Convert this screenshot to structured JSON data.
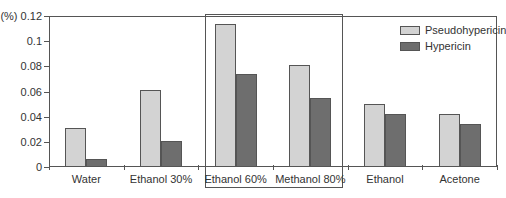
{
  "chart_data": {
    "type": "bar",
    "title": "",
    "xlabel": "",
    "ylabel": "(%)",
    "ylim": [
      0,
      0.12
    ],
    "yticks": [
      "0",
      "0.02",
      "0.04",
      "0.06",
      "0.08",
      "0.1",
      "0.12"
    ],
    "categories": [
      "Water",
      "Ethanol 30%",
      "Ethanol 60%",
      "Methanol 80%",
      "Ethanol",
      "Acetone"
    ],
    "series": [
      {
        "name": "Pseudohypericin",
        "color": "#d3d3d3",
        "values": [
          0.031,
          0.061,
          0.114,
          0.081,
          0.05,
          0.042
        ]
      },
      {
        "name": "Hypericin",
        "color": "#6e6e6e",
        "values": [
          0.006,
          0.021,
          0.074,
          0.055,
          0.042,
          0.034
        ]
      }
    ],
    "highlight": [
      "Ethanol 60%",
      "Methanol 80%"
    ],
    "legend_position": "top-right",
    "grid": false
  },
  "axis": {
    "y_unit": "(%)"
  }
}
